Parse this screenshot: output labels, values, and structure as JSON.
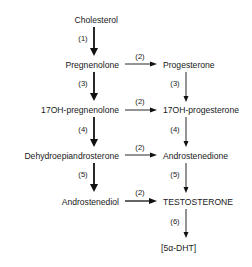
{
  "diagram": {
    "type": "steroid-biosynthesis-pathway",
    "left_column": [
      {
        "id": "cholesterol",
        "label": "Cholesterol"
      },
      {
        "id": "pregnenolone",
        "label": "Pregnenolone"
      },
      {
        "id": "17oh-pregnenolone",
        "label": "17OH-pregnenolone"
      },
      {
        "id": "dhea",
        "label": "Dehydroepiandrosterone"
      },
      {
        "id": "androstenediol",
        "label": "Androstenediol"
      }
    ],
    "right_column": [
      {
        "id": "progesterone",
        "label": "Progesterone"
      },
      {
        "id": "17oh-progesterone",
        "label": "17OH-progesterone"
      },
      {
        "id": "androstenedione",
        "label": "Androstenedione"
      },
      {
        "id": "testosterone",
        "label": "TESTOSTERONE"
      },
      {
        "id": "5a-dht",
        "label": "[5α-DHT]"
      }
    ],
    "edges": [
      {
        "from": "cholesterol",
        "to": "pregnenolone",
        "label": "(1)"
      },
      {
        "from": "pregnenolone",
        "to": "17oh-pregnenolone",
        "label": "(3)"
      },
      {
        "from": "17oh-pregnenolone",
        "to": "dhea",
        "label": "(4)"
      },
      {
        "from": "dhea",
        "to": "androstenediol",
        "label": "(5)"
      },
      {
        "from": "pregnenolone",
        "to": "progesterone",
        "label": "(2)"
      },
      {
        "from": "17oh-pregnenolone",
        "to": "17oh-progesterone",
        "label": "(2)"
      },
      {
        "from": "dhea",
        "to": "androstenedione",
        "label": "(2)"
      },
      {
        "from": "androstenediol",
        "to": "testosterone",
        "label": "(2)"
      },
      {
        "from": "progesterone",
        "to": "17oh-progesterone",
        "label": "(3)"
      },
      {
        "from": "17oh-progesterone",
        "to": "androstenedione",
        "label": "(4)"
      },
      {
        "from": "androstenedione",
        "to": "testosterone",
        "label": "(5)"
      },
      {
        "from": "testosterone",
        "to": "5a-dht",
        "label": "(6)"
      }
    ]
  }
}
